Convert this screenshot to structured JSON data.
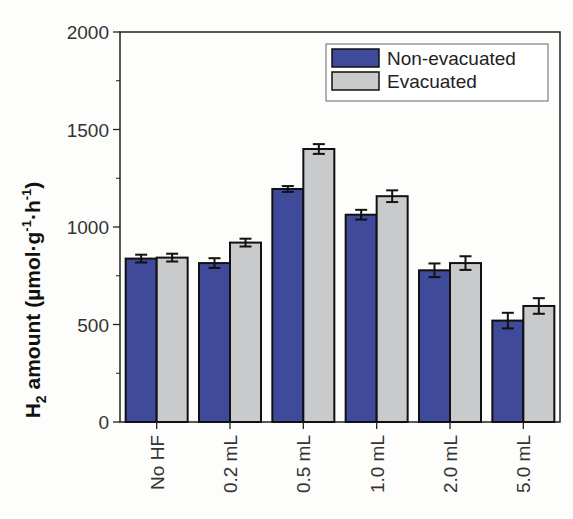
{
  "chart_data": {
    "type": "bar",
    "title": "",
    "xlabel": "",
    "ylabel": "H2 amount (µmol·g-1·h-1)",
    "ylabel_parts": {
      "main": "H",
      "sub": "2",
      "rest": " amount (µmol·g",
      "sup1": "-1",
      "mid": "·h",
      "sup2": "-1",
      "end": ")"
    },
    "ylim": [
      0,
      2000
    ],
    "yticks": [
      0,
      500,
      1000,
      1500,
      2000
    ],
    "categories": [
      "No HF",
      "0.2 mL",
      "0.5 mL",
      "1.0 mL",
      "2.0 mL",
      "5.0 mL"
    ],
    "series": [
      {
        "name": "Non-evacuated",
        "color": "#3f4a9a",
        "values": [
          838,
          815,
          1195,
          1063,
          778,
          520
        ],
        "errors": [
          20,
          25,
          15,
          25,
          35,
          40
        ]
      },
      {
        "name": "Evacuated",
        "color": "#c9cacc",
        "values": [
          843,
          920,
          1400,
          1158,
          815,
          595
        ],
        "errors": [
          20,
          20,
          25,
          30,
          35,
          40
        ]
      }
    ],
    "legend": {
      "position": "upper right",
      "entries": [
        "Non-evacuated",
        "Evacuated"
      ]
    },
    "grid": false
  }
}
